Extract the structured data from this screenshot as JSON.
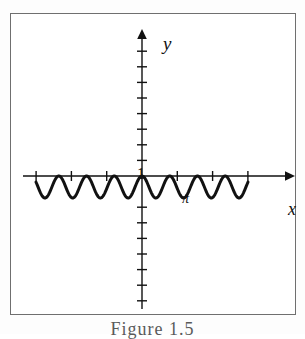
{
  "figure": {
    "caption": "Figure 1.5",
    "background_color": "#ffffff",
    "frame_color": "#6f6f6f",
    "ink_color": "#111111"
  },
  "labels": {
    "y_axis": "y",
    "x_axis": "x",
    "pi_tick": "π",
    "unit_tick": "1"
  },
  "chart_data": {
    "type": "line",
    "title": "Figure 1.5",
    "xlabel": "x",
    "ylabel": "y",
    "grid": false,
    "legend": null,
    "annotations": [
      {
        "text": "1",
        "x": 0,
        "y": 1,
        "note": "unit mark on y-axis, drawn left of the axis just above the x-axis"
      },
      {
        "text": "π",
        "x": 3.14159,
        "y": 0,
        "note": "pi mark on x-axis, drawn just below the axis at the second tick right of the origin"
      }
    ],
    "xlim": [
      -3.9,
      4.4
    ],
    "ylim": [
      -9.7,
      9.7
    ],
    "x_tick_values": [
      -3,
      -2,
      -1,
      1,
      2,
      3
    ],
    "x_tick_labels": [
      "",
      "",
      "",
      "",
      "",
      ""
    ],
    "x_tick_count": 6,
    "y_tick_count": 16,
    "y_tick_step": 1,
    "axis_arrows": {
      "x_positive": true,
      "y_positive": true
    },
    "series": [
      {
        "name": "damped-looking cosine wave below the axis",
        "equation": "y = cos(8x) - 1",
        "amplitude": 1,
        "vertical_offset": -1,
        "angular_frequency": 8,
        "period": 0.7854,
        "phase": 0,
        "x_start": -3.0,
        "x_end": 3.0,
        "y_min": -2,
        "y_max": 0,
        "stroke_width": 3,
        "color": "#111111",
        "note": "peak touches y=0 at x=0; curve lies entirely on or below the x-axis with about 8 full oscillations"
      }
    ]
  },
  "geometry": {
    "frame": {
      "x": 10,
      "y": 13,
      "width": 286,
      "height": 302
    },
    "origin": {
      "x": 131,
      "y": 162
    },
    "x_axis": {
      "start_x": 12,
      "end_x": 280,
      "y": 162
    },
    "y_axis": {
      "x": 131,
      "start_y": 15,
      "end_y": 295
    },
    "x_tick_spacing_px": 35.3,
    "y_tick_spacing_px": 15.6,
    "tick_half_length_px": 5,
    "wave_span_px": {
      "start": 25,
      "end": 237
    },
    "wave_amplitude_px": 11
  }
}
